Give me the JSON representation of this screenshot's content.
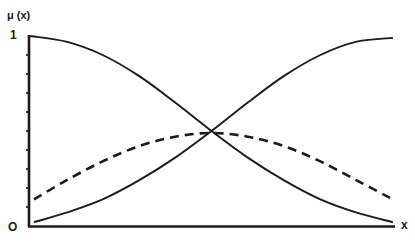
{
  "chart_data": {
    "type": "line",
    "title": "",
    "xlabel": "x",
    "ylabel": "μ (x)",
    "xlim": [
      0,
      1
    ],
    "ylim": [
      0,
      1
    ],
    "y_tick_labels": [
      "O",
      "1"
    ],
    "x_tick_labels": [],
    "origin_label": "O",
    "y_minor_ticks": 9,
    "grid": false,
    "legend": null,
    "series": [
      {
        "name": "decreasing",
        "style": "solid",
        "x": [
          0,
          0.1,
          0.2,
          0.3,
          0.4,
          0.5,
          0.6,
          0.7,
          0.8,
          0.9,
          1.0
        ],
        "y": [
          1.0,
          0.97,
          0.9,
          0.79,
          0.65,
          0.5,
          0.36,
          0.24,
          0.14,
          0.07,
          0.02
        ]
      },
      {
        "name": "increasing",
        "style": "solid",
        "x": [
          0,
          0.1,
          0.2,
          0.3,
          0.4,
          0.5,
          0.6,
          0.7,
          0.8,
          0.9,
          1.0
        ],
        "y": [
          0.02,
          0.07,
          0.14,
          0.24,
          0.36,
          0.5,
          0.65,
          0.79,
          0.9,
          0.97,
          0.99
        ]
      },
      {
        "name": "dashed",
        "style": "dashed",
        "x": [
          0,
          0.1,
          0.2,
          0.3,
          0.4,
          0.5,
          0.6,
          0.7,
          0.8,
          0.9,
          1.0
        ],
        "y": [
          0.14,
          0.24,
          0.34,
          0.42,
          0.47,
          0.49,
          0.47,
          0.42,
          0.34,
          0.24,
          0.14
        ]
      }
    ],
    "annotations": []
  },
  "labels": {
    "ylabel": "μ (x)",
    "y_top": "1",
    "origin": "O",
    "xlabel": "x"
  },
  "style": {
    "ink": "#1a1a1a",
    "background": "#ffffff"
  }
}
